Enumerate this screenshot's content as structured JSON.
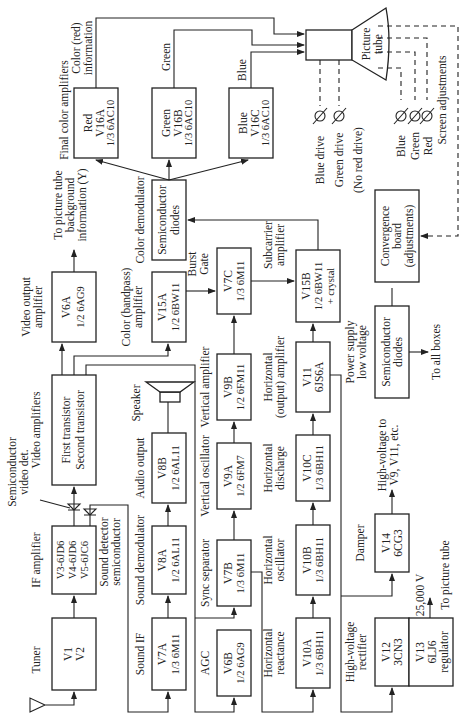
{
  "diagram": {
    "orientation": "rotated 90 degrees counter-clockwise",
    "blocks": {
      "tuner": {
        "caption": "Tuner",
        "lines": [
          "V1",
          "V2"
        ]
      },
      "if_amp": {
        "caption": "IF amplifier",
        "lines": [
          "V3-6JD6",
          "V4-6JD6",
          "V5-6JC6"
        ]
      },
      "video_amps": {
        "caption": "Video amplifiers",
        "lines": [
          "First transistor",
          "Second transistor"
        ]
      },
      "video_out": {
        "caption1": "Video output",
        "caption2": "amplifier",
        "lines": [
          "V6A",
          "1/2 6AG9"
        ]
      },
      "color_demod": {
        "caption": "Color demodulator",
        "lines": [
          "Semiconductor",
          "diodes"
        ]
      },
      "red_amp": {
        "lines": [
          "Red",
          "V16A",
          "1/3 6AC10"
        ]
      },
      "green_amp": {
        "lines": [
          "Green",
          "V16B",
          "1/3 6AC10"
        ]
      },
      "blue_amp": {
        "lines": [
          "Blue",
          "V16C",
          "1/3 6AC10"
        ]
      },
      "picture_tube": {
        "lines": [
          "Picture",
          "tube"
        ]
      },
      "sound_if": {
        "caption": "Sound IF",
        "lines": [
          "V7A",
          "1/3 6M11"
        ]
      },
      "sound_demod": {
        "caption": "Sound demodulator",
        "lines": [
          "V8A",
          "1/2 6AL11"
        ]
      },
      "audio_out": {
        "caption": "Audio output",
        "lines": [
          "V8B",
          "1/2 6AL11"
        ]
      },
      "speaker": {
        "caption": "Speaker"
      },
      "color_bandpass": {
        "caption1": "Color (bandpass)",
        "caption2": "amplifier",
        "lines": [
          "V15A",
          "1/2 6BW11"
        ]
      },
      "burst_gate": {
        "caption1": "Burst",
        "caption2": "Gate",
        "lines": [
          "V7C",
          "1/3 6M11"
        ]
      },
      "agc": {
        "caption": "AGC",
        "lines": [
          "V6B",
          "1/2 6AG9"
        ]
      },
      "sync_sep": {
        "caption": "Sync separator",
        "lines": [
          "V7B",
          "1/3 6M11"
        ]
      },
      "vert_osc": {
        "caption": "Vertical oscillator",
        "lines": [
          "V9A",
          "1/2 6FM7"
        ]
      },
      "vert_amp": {
        "caption": "Vertical amplifier",
        "lines": [
          "V9B",
          "1/2 6FM11"
        ]
      },
      "horiz_react": {
        "caption1": "Horizontal",
        "caption2": "reactance",
        "lines": [
          "V10A",
          "1/3 6BH11"
        ]
      },
      "horiz_osc": {
        "caption1": "Horizontal",
        "caption2": "oscillator",
        "lines": [
          "V10B",
          "1/3 6BH11"
        ]
      },
      "horiz_disch": {
        "caption1": "Horizontal",
        "caption2": "discharge",
        "lines": [
          "V10C",
          "1/3 6BH11"
        ]
      },
      "horiz_out": {
        "caption1": "Horizontal",
        "caption2": "(output) amplifier",
        "lines": [
          "V11",
          "6JS6A"
        ]
      },
      "subcarrier": {
        "caption1": "Subcarrier",
        "caption2": "amplifier",
        "lines": [
          "V15B",
          "1/2 6BW11",
          "+ crystal"
        ]
      },
      "hv_rect": {
        "caption1": "High-voltage",
        "caption2": "rectifier",
        "lines": [
          "V12",
          "3CN3"
        ]
      },
      "regulator": {
        "lines": [
          "V13",
          "6LJ6",
          "regulator"
        ]
      },
      "damper": {
        "caption": "Damper",
        "lines": [
          "V14",
          "6CG3"
        ]
      },
      "power_supply": {
        "caption1": "Power supply",
        "caption2": "low voltage",
        "lines": [
          "Semiconductor",
          "diodes"
        ]
      },
      "convergence": {
        "lines": [
          "Convergence",
          "board",
          "(adjustments)"
        ]
      }
    },
    "labels": {
      "semi_video_det1": "Semiconductor",
      "semi_video_det2": "video det.",
      "sound_det1": "Sound detector",
      "sound_det2": "semiconductor",
      "to_tube_bg1": "To picture tube",
      "to_tube_bg2": "background",
      "to_tube_bg3": "information  (Y)",
      "final_color": "Final color amplifiers",
      "color_red1": "Color (red)",
      "color_red2": "information",
      "green": "Green",
      "blue": "Blue",
      "blue_drive": "Blue drive",
      "green_drive": "Green drive",
      "no_red_drive": "(No red drive)",
      "scr_blue": "Blue",
      "scr_green": "Green",
      "scr_red": "Red",
      "screen_adj": "Screen adjustments",
      "hv_to1": "High-voltage to",
      "hv_to2": "V9, V11, etc.",
      "to_all_boxes": "To all boxes",
      "kv": "25,000 V",
      "to_picture_tube": "To picture tube"
    }
  }
}
